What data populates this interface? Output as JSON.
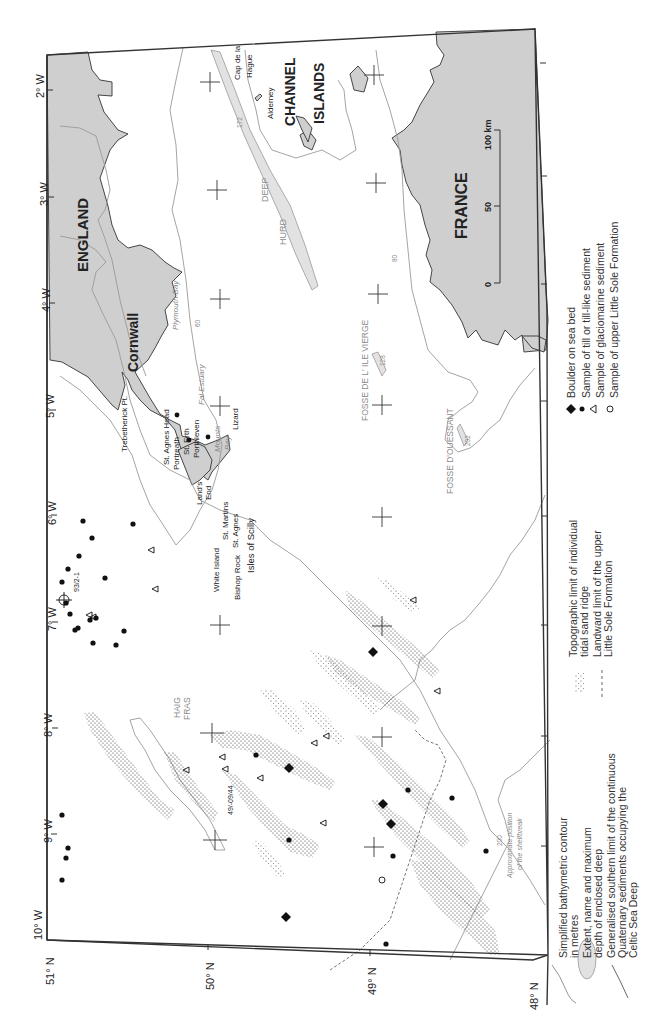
{
  "map": {
    "orientation": "rotated 90 degrees clockwise (north at left)",
    "longitude_labels": [
      "2° W",
      "3° W",
      "4° W",
      "5° W",
      "6° W",
      "7° W",
      "8° W",
      "9° W",
      "10° W"
    ],
    "latitude_labels": [
      "51° N",
      "50° N",
      "49° N",
      "48° N"
    ],
    "land_labels": {
      "england": "ENGLAND",
      "cornwall": "Cornwall",
      "france": "FRANCE",
      "channel_islands_1": "CHANNEL",
      "channel_islands_2": "ISLANDS"
    },
    "place_labels": {
      "alderney": "Alderney",
      "cap_de_la_hague_1": "Cap de la",
      "cap_de_la_hague_2": "Hague",
      "trebetherick": "Trebetherick Pt.",
      "st_agnes_head": "St. Agnes Head",
      "portreath": "Portreath",
      "st_erth": "St. Erth",
      "porthleven": "Porthleven",
      "lizard": "Lizard",
      "lands_end_1": "Land's",
      "lands_end_2": "End",
      "st_martins": "St. Martins",
      "st_agnes": "St. Agnes",
      "white_island": "White Island",
      "bishop_rock": "Bishop Rock",
      "isles_of_scilly": "Isles of Scilly",
      "plymouth_bay": "Plymouth Bay",
      "fal_estuary": "Fal Estuary",
      "mounts_bay_1": "Mounts",
      "mounts_bay_2": "Bay",
      "haig_fras_1": "HAIG",
      "haig_fras_2": "FRAS",
      "hurd_deep_1": "HURD",
      "hurd_deep_2": "DEEP",
      "fosse_ile_vierge": "FOSSE DE L' ILE VIERGE",
      "fosse_ouessant": "FOSSE D'OUESSANT",
      "shelfbreak_1": "Approximate position",
      "shelfbreak_2": "of the shelfbreak",
      "sample_93_2_1": "93/2-1",
      "sample_49_09_44": "49/-09/44"
    },
    "contour_values": {
      "hurd_deep_depth": "172",
      "ile_vierge_depth": "128",
      "ouessant_depth": "202",
      "contour_60": "60",
      "contour_80": "80",
      "contour_200": "200"
    },
    "scale_bar": {
      "labels": [
        "0",
        "50",
        "100 km"
      ]
    }
  },
  "legend": {
    "items": [
      {
        "symbol": "contour-line",
        "text_1": "Simplified bathymetric contour",
        "text_2": "in metres"
      },
      {
        "symbol": "enclosed-deep",
        "text_1": "Extent, name and maximum",
        "text_2": "depth of enclosed deep",
        "sample_name": "HURD DEEP",
        "sample_depth": "172"
      },
      {
        "symbol": "southern-limit",
        "text_1": "Generalised southern limit of the continuous",
        "text_2": "Quaternary sediments occupying the",
        "text_3": "Celtic Sea Deep"
      },
      {
        "symbol": "sand-ridge",
        "text_1": "Topographic limit of individual",
        "text_2": "tidal sand ridge"
      },
      {
        "symbol": "landward-limit",
        "text_1": "Landward limit of the  upper",
        "text_2": "Little Sole Formation"
      },
      {
        "symbol": "filled-diamond",
        "text_1": "Boulder on sea bed"
      },
      {
        "symbol": "filled-dot",
        "text_1": "Sample of till or till-like sediment"
      },
      {
        "symbol": "triangle",
        "text_1": "Sample of glaciomarine sediment"
      },
      {
        "symbol": "open-circle",
        "text_1": "Sample of upper Little Sole Formation"
      }
    ]
  },
  "colors": {
    "land": "#cfcfcf",
    "deep_fill": "#e2e2e2",
    "contour": "#9a9a9a",
    "frame": "#333333"
  }
}
